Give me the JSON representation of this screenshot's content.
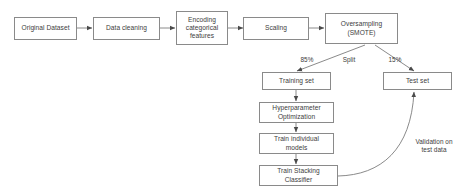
{
  "diagram": {
    "background_color": "#ffffff",
    "border_color": "#8a8a8a",
    "text_color": "#3c3c3c",
    "nodes": [
      {
        "id": "original_dataset",
        "label": "Original Dataset"
      },
      {
        "id": "data_cleaning",
        "label": "Data cleaning"
      },
      {
        "id": "encoding",
        "label": "Encoding\ncategorical\nfeatures"
      },
      {
        "id": "scaling",
        "label": "Scaling"
      },
      {
        "id": "oversampling",
        "label": "Oversampling\n(SMOTE)"
      },
      {
        "id": "training_set",
        "label": "Training set"
      },
      {
        "id": "test_set",
        "label": "Test set"
      },
      {
        "id": "hyperparameter",
        "label": "Hyperparameter\nOptimization"
      },
      {
        "id": "train_individual",
        "label": "Train individual\nmodels"
      },
      {
        "id": "train_stacking",
        "label": "Train Stacking\nClassifier"
      }
    ],
    "edge_labels": [
      {
        "id": "split_left",
        "label": "85%"
      },
      {
        "id": "split_center",
        "label": "Split"
      },
      {
        "id": "split_right",
        "label": "15%"
      },
      {
        "id": "validation",
        "label": "Validation on\ntest data"
      }
    ]
  }
}
